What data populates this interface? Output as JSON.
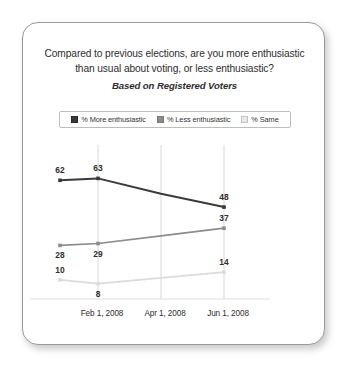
{
  "card": {
    "title_line_1": "Compared to previous elections, are you more enthusiastic",
    "title_line_2": "than usual about voting, or less enthusiastic?",
    "subtitle": "Based on Registered Voters"
  },
  "legend": {
    "position": "top-center",
    "items": [
      {
        "label": "% More enthusiastic",
        "color": "#3a3a3a",
        "swatch_name": "legend-swatch-more-enthusiastic"
      },
      {
        "label": "% Less enthusiastic",
        "color": "#8c8c8c",
        "swatch_name": "legend-swatch-less-enthusiastic"
      },
      {
        "label": "% Same",
        "color": "#e2e2e2",
        "swatch_name": "legend-swatch-same"
      }
    ]
  },
  "chart_data": {
    "type": "line",
    "title": "Compared to previous elections, are you more enthusiastic than usual about voting, or less enthusiastic?",
    "subtitle": "Based on Registered Voters",
    "xlabel": "",
    "ylabel": "",
    "ylim": [
      0,
      70
    ],
    "grid": "vertical",
    "legend_position": "top-center",
    "x": [
      "",
      "Feb 1, 2008",
      "Apr 1, 2008",
      "Jun 1, 2008"
    ],
    "tick_labels": [
      "Feb 1, 2008",
      "Apr 1, 2008",
      "Jun 1, 2008"
    ],
    "series": [
      {
        "name": "% More enthusiastic",
        "color": "#3a3a3a",
        "values": [
          62,
          63,
          55,
          48
        ],
        "labels": [
          {
            "x_index": 0,
            "value": 62,
            "text": "62",
            "position": "above"
          },
          {
            "x_index": 1,
            "value": 63,
            "text": "63",
            "position": "above"
          },
          {
            "x_index": 3,
            "value": 48,
            "text": "48",
            "position": "above"
          }
        ]
      },
      {
        "name": "% Less enthusiastic",
        "color": "#8c8c8c",
        "values": [
          28,
          29,
          33,
          37
        ],
        "labels": [
          {
            "x_index": 0,
            "value": 28,
            "text": "28",
            "position": "below"
          },
          {
            "x_index": 1,
            "value": 29,
            "text": "29",
            "position": "below"
          },
          {
            "x_index": 3,
            "value": 37,
            "text": "37",
            "position": "above"
          }
        ]
      },
      {
        "name": "% Same",
        "color": "#dcdcdc",
        "values": [
          10,
          8,
          11,
          14
        ],
        "labels": [
          {
            "x_index": 0,
            "value": 10,
            "text": "10",
            "position": "above"
          },
          {
            "x_index": 1,
            "value": 8,
            "text": "8",
            "position": "below"
          },
          {
            "x_index": 3,
            "value": 14,
            "text": "14",
            "position": "above"
          }
        ]
      }
    ]
  }
}
